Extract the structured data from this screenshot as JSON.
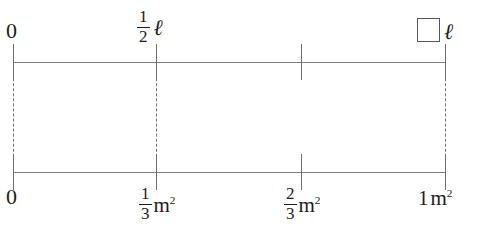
{
  "diagram": {
    "type": "double-number-line",
    "top_line": {
      "name": "length-axis",
      "unit_symbol": "ℓ",
      "ticks": [
        {
          "id": "top-0",
          "x": 13,
          "label": "0",
          "label_kind": "plain",
          "has_connector": true,
          "has_unit": false
        },
        {
          "id": "top-half",
          "x": 156,
          "label": "1/2",
          "label_kind": "fraction",
          "numerator": "1",
          "denominator": "2",
          "has_connector": true,
          "has_unit": true
        },
        {
          "id": "top-mid",
          "x": 301,
          "label": "",
          "label_kind": "none",
          "has_connector": false,
          "has_unit": false
        },
        {
          "id": "top-one",
          "x": 445,
          "label": "",
          "label_kind": "blank",
          "has_connector": true,
          "has_unit": true
        }
      ]
    },
    "bottom_line": {
      "name": "area-axis",
      "unit_symbol": "m",
      "unit_exponent": "2",
      "ticks": [
        {
          "id": "bot-0",
          "x": 13,
          "label": "0",
          "label_kind": "plain",
          "has_unit": false
        },
        {
          "id": "bot-third",
          "x": 156,
          "label": "1/3",
          "label_kind": "fraction",
          "numerator": "1",
          "denominator": "3",
          "has_unit": true
        },
        {
          "id": "bot-twothirds",
          "x": 301,
          "label": "2/3",
          "label_kind": "fraction",
          "numerator": "2",
          "denominator": "3",
          "has_unit": true
        },
        {
          "id": "bot-one",
          "x": 445,
          "label": "1",
          "label_kind": "plain",
          "has_unit": true
        }
      ]
    },
    "labels": {
      "top_zero": "0",
      "top_half_num": "1",
      "top_half_den": "2",
      "top_unit_ell": "ℓ",
      "top_blank_unit_ell": "ℓ",
      "bottom_zero": "0",
      "bottom_third_num": "1",
      "bottom_third_den": "3",
      "bottom_twothirds_num": "2",
      "bottom_twothirds_den": "3",
      "bottom_one": "1",
      "unit_m": "m",
      "unit_exp": "2"
    },
    "answer_blank": {
      "name": "missing-value-box",
      "value": "",
      "placeholder": ""
    },
    "colors": {
      "line": "#7d7d7d",
      "tick": "#6f6f6f",
      "text": "#1c1c1c",
      "box_border": "#585858",
      "background": "#ffffff"
    }
  }
}
